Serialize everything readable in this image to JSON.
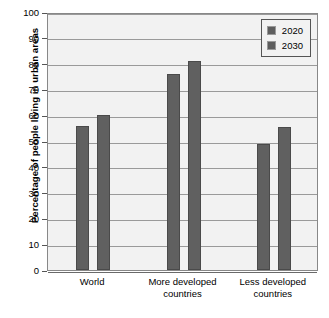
{
  "chart_data": {
    "type": "bar",
    "title": "",
    "xlabel": "",
    "ylabel": "Percentage of people living in urban areas",
    "ylim": [
      0,
      100
    ],
    "yticks": [
      0,
      10,
      20,
      30,
      40,
      50,
      60,
      70,
      80,
      90,
      100
    ],
    "ytick_labels": [
      "0",
      "10",
      "20",
      "30",
      "40",
      "50",
      "60",
      "70",
      "80",
      "90",
      "100"
    ],
    "grid": "horizontal",
    "legend_position": "top-right",
    "categories": [
      "World",
      "More developed countries",
      "Less developed countries"
    ],
    "category_lines": [
      [
        "World"
      ],
      [
        "More developed",
        "countries"
      ],
      [
        "Less developed",
        "countries"
      ]
    ],
    "series": [
      {
        "name": "2020",
        "color": "#606060",
        "values": [
          56,
          76,
          49
        ]
      },
      {
        "name": "2030",
        "color": "#606060",
        "values": [
          60,
          81,
          55.5
        ]
      }
    ]
  },
  "legend": {
    "entries": [
      {
        "label": "2020"
      },
      {
        "label": "2030"
      }
    ]
  },
  "colors": {
    "bar": "#606060",
    "bar_border": "#4a4a4a",
    "plot_background": "#f2f2f2",
    "gridline": "#9a9a9a",
    "axis": "#555555",
    "text": "#000000"
  }
}
